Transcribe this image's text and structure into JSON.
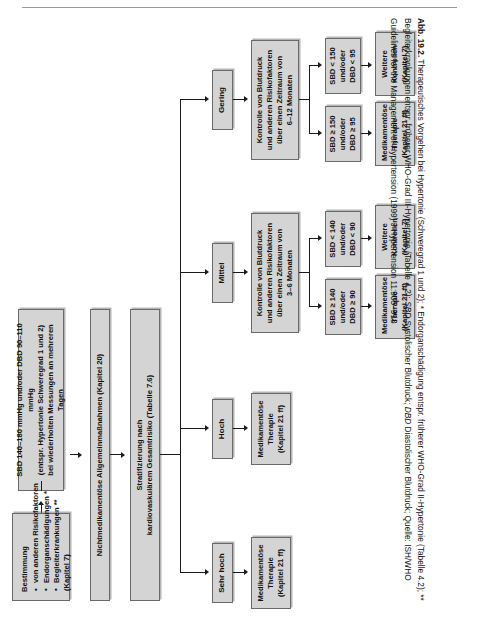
{
  "figure": {
    "label": "Abb. 19.2.",
    "caption_text": " Therapeutisches Vorgehen bei Hypertonie (Schweregrad 1 und 2); * Endorganschädigung entspr. früherer WHO-Grad II-Hypertonie (Tabelle 4.2); ** Begleiterkrankungen entspr. früherer WHO-Grad III-Hypertonie (Tabelle 4.2); ",
    "abbr_sbd": "SBD",
    "abbr_sbd_text": " Systolischer Blutdruck; ",
    "abbr_dbd": "DBD",
    "abbr_dbd_text": " Diastolischer Blutdruck; Quelle: ISH/WHO Guidelines for the Management of Hypertension (1999) J Hypertension 11:905–918"
  },
  "flow": {
    "entry": {
      "line1": "SBD 140–180 mmHg und/oder DBD 90–110 mmHg",
      "line2": "(entspr. Hypertonie Schweregrad 1 und 2)",
      "line3": "bei wiederholten Messungen an mehreren Tagen"
    },
    "assessment": {
      "header": "Bestimmung",
      "items": [
        "von anderen Risikofaktoren",
        "Endorganschädigungen *",
        "Begleiterkrankungen **"
      ],
      "subnote": "(Kapitel 7)"
    },
    "nonpharma": "Nichtmedikamentöse Allgemeinmaßnahmen (Kapitel 20)",
    "stratification": {
      "line1": "Stratifizierung nach",
      "line2": "kardiovaskulärem Gesamtrisiko (Tabelle 7.6)"
    },
    "risk_levels": [
      {
        "label": "Sehr hoch"
      },
      {
        "label": "Hoch"
      },
      {
        "label": "Mittel"
      },
      {
        "label": "Gering"
      }
    ],
    "branch_very_high": {
      "therapy_line1": "Medikamentöse",
      "therapy_line2": "Therapie",
      "therapy_line3": "(Kapitel 21 ff)"
    },
    "branch_high": {
      "therapy_line1": "Medikamentöse",
      "therapy_line2": "Therapie",
      "therapy_line3": "(Kapitel 21 ff)"
    },
    "branch_medium": {
      "monitor_line1": "Kontrolle von Blutdruck",
      "monitor_line2": "und anderen Risikofaktoren",
      "monitor_line3": "über einen Zeitraum von",
      "monitor_line4": "3–6 Monaten",
      "high_bp_line1": "SBD ≥ 140",
      "high_bp_line2": "und/oder",
      "high_bp_line3": "DBD ≥ 90",
      "low_bp_line1": "SBD < 140",
      "low_bp_line2": "und/oder",
      "low_bp_line3": "DBD < 90",
      "high_out_line1": "Medikamentöse",
      "high_out_line2": "Therapie",
      "high_out_line3": "(Kapitel 21 ff)",
      "low_out_line1": "Weitere",
      "low_out_line2": "Kontrollen",
      "low_out_line3": "(Kapitel 7)"
    },
    "branch_low": {
      "monitor_line1": "Kontrolle von Blutdruck",
      "monitor_line2": "und anderen Risikofaktoren",
      "monitor_line3": "über einen Zeitraum von",
      "monitor_line4": "6–12 Monaten",
      "high_bp_line1": "SBD ≥ 150",
      "high_bp_line2": "und/oder",
      "high_bp_line3": "DBD ≥ 95",
      "low_bp_line1": "SBD < 150",
      "low_bp_line2": "und/oder",
      "low_bp_line3": "DBD < 95",
      "high_out_line1": "Medikamentöse",
      "high_out_line2": "Therapie",
      "high_out_line3": "(Kapitel 21 ff)",
      "low_out_line1": "Weitere",
      "low_out_line2": "Kontrollen",
      "low_out_line3": "(Kapitel 7)"
    }
  },
  "colors": {
    "node_fill": "#d4d4d4",
    "node_border": "#6a6a6a",
    "connector": "#1a1a1a",
    "rule": "#9a9a9a"
  }
}
